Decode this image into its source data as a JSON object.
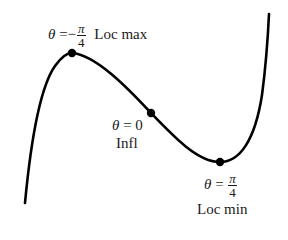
{
  "figure": {
    "type": "function-curve-critical-points",
    "curve_color": "#000000",
    "dot_color": "#000000",
    "points": [
      {
        "id": "loc-max",
        "theta_symbol": "θ",
        "equals": "=",
        "sign": "−",
        "numerator": "π",
        "denominator": "4",
        "label": "Loc max"
      },
      {
        "id": "inflection",
        "theta_symbol": "θ",
        "equals": "=",
        "value": "0",
        "label": "Infl"
      },
      {
        "id": "loc-min",
        "theta_symbol": "θ",
        "equals": "=",
        "numerator": "π",
        "denominator": "4",
        "label": "Loc min"
      }
    ]
  }
}
